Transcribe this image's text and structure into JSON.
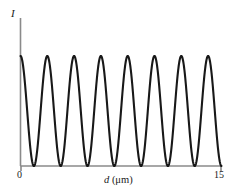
{
  "figure": {
    "axis_color": "#8a8a8a",
    "curve_color": "#181818",
    "background": "#ffffff",
    "ylabel": "I",
    "xlabel_var": "d",
    "xlabel_unit": "(μm)",
    "xlabel_full": "d (μm)",
    "xtick_left": "0",
    "xtick_right": "15"
  },
  "chart_data": {
    "type": "line",
    "title": "",
    "subtitle": "",
    "xlabel": "d (μm)",
    "ylabel": "I",
    "xlim": [
      0,
      15
    ],
    "ylim": [
      0,
      1
    ],
    "grid": false,
    "legend": null,
    "xticks": [
      0,
      15
    ],
    "xticklabels": [
      "0",
      "15"
    ],
    "yticks": [],
    "yticklabels": [],
    "annotations": [],
    "function": "I = cos^2(pi * d / 2)",
    "period_um": 2,
    "num_maxima_visible": 8,
    "maxima_d": [
      0,
      2,
      4,
      6,
      8,
      10,
      12,
      14
    ],
    "minima_d": [
      1,
      3,
      5,
      7,
      9,
      11,
      13,
      15
    ],
    "series": [
      {
        "name": "I(d)",
        "color": "#181818",
        "x": [
          0,
          0.25,
          0.5,
          0.75,
          1,
          1.25,
          1.5,
          1.75,
          2,
          2.25,
          2.5,
          2.75,
          3,
          3.25,
          3.5,
          3.75,
          4,
          4.25,
          4.5,
          4.75,
          5,
          5.25,
          5.5,
          5.75,
          6,
          6.25,
          6.5,
          6.75,
          7,
          7.25,
          7.5,
          7.75,
          8,
          8.25,
          8.5,
          8.75,
          9,
          9.25,
          9.5,
          9.75,
          10,
          10.25,
          10.5,
          10.75,
          11,
          11.25,
          11.5,
          11.75,
          12,
          12.25,
          12.5,
          12.75,
          13,
          13.25,
          13.5,
          13.75,
          14,
          14.25,
          14.5,
          14.75,
          15
        ],
        "y": [
          1,
          0.854,
          0.5,
          0.146,
          0,
          0.146,
          0.5,
          0.854,
          1,
          0.854,
          0.5,
          0.146,
          0,
          0.146,
          0.5,
          0.854,
          1,
          0.854,
          0.5,
          0.146,
          0,
          0.146,
          0.5,
          0.854,
          1,
          0.854,
          0.5,
          0.146,
          0,
          0.146,
          0.5,
          0.854,
          1,
          0.854,
          0.5,
          0.146,
          0,
          0.146,
          0.5,
          0.854,
          1,
          0.854,
          0.5,
          0.146,
          0,
          0.146,
          0.5,
          0.854,
          1,
          0.854,
          0.5,
          0.146,
          0,
          0.146,
          0.5,
          0.854,
          1,
          0.854,
          0.5,
          0.146,
          0
        ]
      }
    ]
  }
}
